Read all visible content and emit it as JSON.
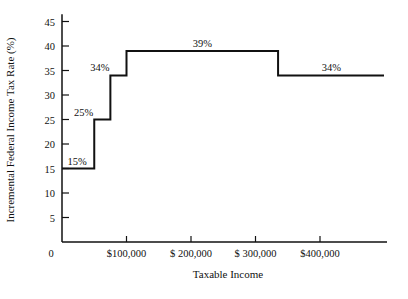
{
  "chart_data": {
    "type": "line",
    "subtype": "step",
    "title": "",
    "xlabel": "Taxable Income",
    "ylabel": "Incremental Federal Income Tax Rate (%)",
    "xlim": [
      0,
      500000
    ],
    "ylim": [
      0,
      45
    ],
    "grid": false,
    "legend": "none",
    "x_ticks": [
      {
        "value": 0,
        "label": "0"
      },
      {
        "value": 100000,
        "label": "$100,000"
      },
      {
        "value": 200000,
        "label": "$ 200,000"
      },
      {
        "value": 300000,
        "label": "$ 300,000"
      },
      {
        "value": 400000,
        "label": "$400,000"
      }
    ],
    "y_ticks": [
      5,
      10,
      15,
      20,
      25,
      30,
      35,
      40,
      45
    ],
    "series": [
      {
        "name": "Incremental tax rate",
        "steps": [
          {
            "x_start": 0,
            "x_end": 50000,
            "rate": 15,
            "label": "15%"
          },
          {
            "x_start": 50000,
            "x_end": 75000,
            "rate": 25,
            "label": "25%"
          },
          {
            "x_start": 75000,
            "x_end": 100000,
            "rate": 34,
            "label": "34%"
          },
          {
            "x_start": 100000,
            "x_end": 335000,
            "rate": 39,
            "label": "39%"
          },
          {
            "x_start": 335000,
            "x_end": 500000,
            "rate": 34,
            "label": "34%"
          }
        ]
      }
    ]
  }
}
